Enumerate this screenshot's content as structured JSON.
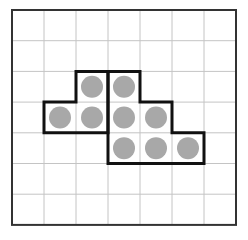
{
  "grid": {
    "cols": 7,
    "rows": 7,
    "x0": 12,
    "y0": 10,
    "cell_w": 32,
    "cell_h": 30.7,
    "line_color": "#c4c4c4",
    "border_color": "#333333"
  },
  "shapes": [
    {
      "name": "left-l-shape",
      "cells": [
        [
          2,
          2
        ],
        [
          1,
          3
        ],
        [
          2,
          3
        ]
      ],
      "outline_color": "#111111"
    },
    {
      "name": "right-staircase-shape",
      "cells": [
        [
          3,
          2
        ],
        [
          3,
          3
        ],
        [
          4,
          3
        ],
        [
          3,
          4
        ],
        [
          4,
          4
        ],
        [
          5,
          4
        ]
      ],
      "outline_color": "#111111"
    }
  ],
  "dots": {
    "color": "#a8a8a8",
    "radius": 11,
    "cells": [
      [
        2,
        2
      ],
      [
        3,
        2
      ],
      [
        1,
        3
      ],
      [
        2,
        3
      ],
      [
        3,
        3
      ],
      [
        4,
        3
      ],
      [
        3,
        4
      ],
      [
        4,
        4
      ],
      [
        5,
        4
      ]
    ]
  }
}
